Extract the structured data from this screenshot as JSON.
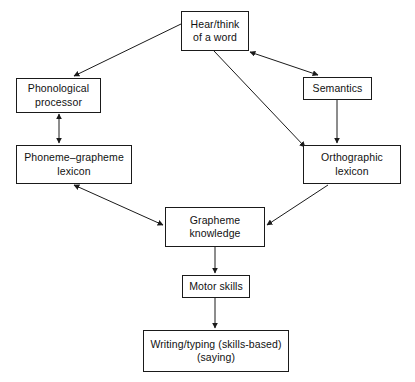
{
  "diagram": {
    "type": "flowchart",
    "background_color": "#ffffff",
    "stroke_color": "#1a1a1a",
    "text_color": "#111111",
    "nodes": [
      {
        "id": "hear",
        "label": "Hear/think\nof a word"
      },
      {
        "id": "phono",
        "label": "Phonological\nprocessor"
      },
      {
        "id": "sem",
        "label": "Semantics"
      },
      {
        "id": "pglex",
        "label": "Phoneme–grapheme\nlexicon"
      },
      {
        "id": "ortho",
        "label": "Orthographic\nlexicon"
      },
      {
        "id": "graph",
        "label": "Grapheme\nknowledge"
      },
      {
        "id": "motor",
        "label": "Motor skills"
      },
      {
        "id": "write",
        "label": "Writing/typing (skills-based)\n(saying)"
      }
    ],
    "edges": [
      {
        "from": "hear",
        "to": "phono",
        "direction": "one-way"
      },
      {
        "from": "hear",
        "to": "sem",
        "direction": "two-way"
      },
      {
        "from": "hear",
        "to": "ortho",
        "direction": "one-way"
      },
      {
        "from": "phono",
        "to": "pglex",
        "direction": "two-way"
      },
      {
        "from": "sem",
        "to": "ortho",
        "direction": "one-way"
      },
      {
        "from": "pglex",
        "to": "graph",
        "direction": "two-way"
      },
      {
        "from": "ortho",
        "to": "graph",
        "direction": "one-way"
      },
      {
        "from": "graph",
        "to": "motor",
        "direction": "one-way"
      },
      {
        "from": "motor",
        "to": "write",
        "direction": "one-way"
      }
    ]
  }
}
